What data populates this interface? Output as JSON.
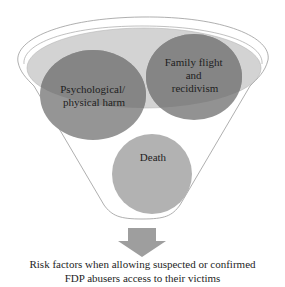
{
  "diagram": {
    "type": "funnel",
    "circles": [
      {
        "id": "psych",
        "lines": [
          "Psychological/",
          "physical harm"
        ]
      },
      {
        "id": "family",
        "lines": [
          "Family flight",
          "and",
          "recidivism"
        ]
      },
      {
        "id": "death",
        "lines": [
          "Death"
        ]
      }
    ],
    "caption": {
      "line1": "Risk factors when allowing suspected or confirmed",
      "line2": "FDP abusers access to their victims"
    },
    "colors": {
      "funnel_outline": "#9a9a9a",
      "inner_ellipse_fill": "#d2d2d2",
      "circle_upper_fill": "#8e8e8e",
      "circle_lower_fill": "#a9a9a9",
      "death_fill": "#b3b3b3",
      "arrow_fill": "#9e9e9e"
    }
  }
}
